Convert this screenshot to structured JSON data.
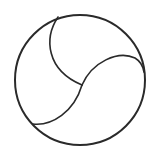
{
  "icon": {
    "name": "volleyball-icon",
    "stroke_color": "#2a2a2a",
    "background": "#ffffff",
    "outline": {
      "cx": 80,
      "cy": 80,
      "r": 65,
      "stroke_width": 2
    },
    "seams": [
      {
        "name": "seam-top-left",
        "d": "M 58 17 C 44 38, 46 70, 82 85"
      },
      {
        "name": "seam-right",
        "d": "M 82 85 C 92 62, 118 50, 135 58 C 140 61, 143 66, 144 72"
      },
      {
        "name": "seam-bottom-left",
        "d": "M 82 85 C 74 112, 52 126, 33 124"
      }
    ]
  }
}
